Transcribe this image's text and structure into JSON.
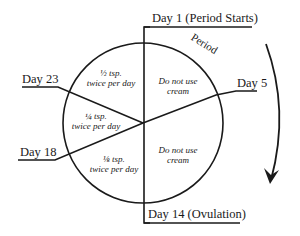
{
  "diagram": {
    "labels": {
      "day1": "Day 1 (Period Starts)",
      "day5": "Day 5",
      "day14": "Day 14 (Ovulation)",
      "day18": "Day 18",
      "day23": "Day 23",
      "period": "Period"
    },
    "segments": [
      {
        "id": "right-top",
        "line1": "Do not use",
        "line2": "cream"
      },
      {
        "id": "right-bottom",
        "line1": "Do not use",
        "line2": "cream"
      },
      {
        "id": "left-top",
        "line1": "½ tsp.",
        "line2": "twice per day"
      },
      {
        "id": "left-middle",
        "line1": "¼ tsp.",
        "line2": "twice per day"
      },
      {
        "id": "left-bottom",
        "line1": "⅛ tsp.",
        "line2": "twice per day"
      }
    ],
    "colors": {
      "ink": "#1a1a1a",
      "background": "#ffffff"
    }
  }
}
